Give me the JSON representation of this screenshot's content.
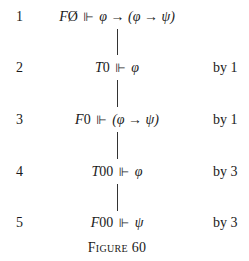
{
  "tableau": {
    "rows": [
      {
        "number": "1",
        "sign": "F",
        "node": "Ø",
        "forces": "⊩",
        "formula": "φ → (φ → ψ)",
        "justification": ""
      },
      {
        "number": "2",
        "sign": "T",
        "node": "0",
        "forces": "⊩",
        "formula": "φ",
        "justification": "by 1"
      },
      {
        "number": "3",
        "sign": "F",
        "node": "0",
        "forces": "⊩",
        "formula": "(φ → ψ)",
        "justification": "by 1"
      },
      {
        "number": "4",
        "sign": "T",
        "node": "00",
        "forces": "⊩",
        "formula": "φ",
        "justification": "by 3"
      },
      {
        "number": "5",
        "sign": "F",
        "node": "00",
        "forces": "⊩",
        "formula": "ψ",
        "justification": "by 3"
      }
    ],
    "caption": "Figure 60"
  }
}
